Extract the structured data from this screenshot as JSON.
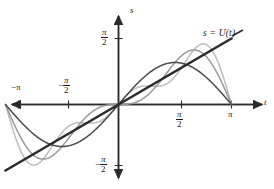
{
  "figure": {
    "title": "",
    "curve_label": "s = U(t)",
    "axes": {
      "x_axis_name": "t",
      "y_axis_name": "s"
    },
    "x_ticks": [
      {
        "label_prefix": "−",
        "num": "π",
        "den": "",
        "value": -3.14159,
        "text": "−π"
      },
      {
        "label_prefix": "−",
        "num": "π",
        "den": "2",
        "value": -1.5708,
        "text": "−π/2"
      },
      {
        "label_prefix": "",
        "num": "π",
        "den": "2",
        "value": 1.5708,
        "text": "π/2"
      },
      {
        "label_prefix": "",
        "num": "π",
        "den": "",
        "value": 3.14159,
        "text": "π"
      }
    ],
    "y_ticks": [
      {
        "label_prefix": "",
        "num": "π",
        "den": "2",
        "value": 1.5708,
        "text": "π/2"
      },
      {
        "label_prefix": "−",
        "num": "π",
        "den": "2",
        "value": -1.5708,
        "text": "−π/2"
      }
    ]
  },
  "chart_data": {
    "type": "line",
    "title": "",
    "subtitle": "",
    "xlabel": "t",
    "ylabel": "s",
    "xlim": [
      -3.4,
      3.6
    ],
    "ylim": [
      -1.9,
      1.9
    ],
    "grid": false,
    "legend_position": "upper-right-inline",
    "annotations": [
      {
        "text": "s = U(t)",
        "x": 2.9,
        "y": 1.55,
        "anchor": "left"
      }
    ],
    "x_tick_values": [
      -3.14159,
      -1.5708,
      1.5708,
      3.14159
    ],
    "x_tick_labels": [
      "−π",
      "−π/2",
      "π/2",
      "π"
    ],
    "y_tick_values": [
      1.5708,
      -1.5708
    ],
    "y_tick_labels": [
      "π/2",
      "−π/2"
    ],
    "series": [
      {
        "name": "s = U(t)",
        "kind": "line",
        "color": "#2b2b2b",
        "width": 2.6,
        "description": "straight line s = t from t = -pi to t = pi",
        "x": [
          -3.14159,
          3.14159
        ],
        "values": [
          -3.14159,
          3.14159
        ],
        "scaled_note": "drawn as s = t, endpoints (-pi,-pi) and (pi,pi) clipped to plot box"
      },
      {
        "name": "first partial sum (n=1)",
        "kind": "line",
        "color": "#4a4a4a",
        "width": 1.5,
        "description": "2 sin(t)",
        "harmonics": 1,
        "coefficients": [
          2.0
        ],
        "peak": {
          "x": 1.5708,
          "y": 2.0
        }
      },
      {
        "name": "second partial sum (n=2)",
        "kind": "line",
        "color": "#9a9a9a",
        "width": 1.5,
        "description": "2 sin(t) - sin(2t)",
        "harmonics": 2,
        "coefficients": [
          2.0,
          -1.0
        ],
        "peak": {
          "x": 2.0944,
          "y": 2.598
        }
      },
      {
        "name": "third partial sum (n=3)",
        "kind": "line",
        "color": "#bdbdbd",
        "width": 1.5,
        "description": "2 sin(t) - sin(2t) + (2/3) sin(3t)",
        "harmonics": 3,
        "coefficients": [
          2.0,
          -1.0,
          0.6667
        ],
        "peak": {
          "x": 2.35,
          "y": 2.77
        }
      }
    ]
  },
  "colors": {
    "axis": "#2b2b2b",
    "line_dark": "#2b2b2b",
    "curve_mid": "#4a4a4a",
    "curve_light": "#9a9a9a",
    "curve_lightest": "#bdbdbd",
    "background": "#ffffff"
  }
}
